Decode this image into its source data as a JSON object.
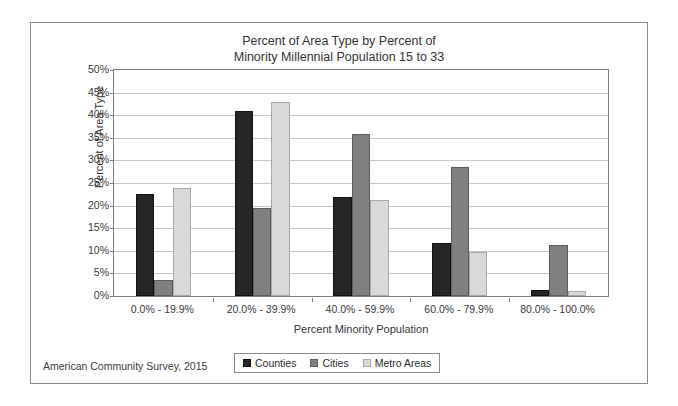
{
  "chart_data": {
    "type": "bar",
    "title": "Percent of Area Type by Percent of Minority Millennial Population 15 to 33",
    "title_lines": [
      "Percent of Area Type by Percent of",
      "Minority Millennial Population 15 to 33"
    ],
    "xlabel": "Percent Minority Population",
    "ylabel": "Percent of Area Type",
    "categories": [
      "0.0% - 19.9%",
      "20.0% - 39.9%",
      "40.0% - 59.9%",
      "60.0% - 79.9%",
      "80.0% - 100.0%"
    ],
    "series": [
      {
        "name": "Counties",
        "color": "#262626",
        "values": [
          22.5,
          41.0,
          22.0,
          11.7,
          1.3
        ]
      },
      {
        "name": "Cities",
        "color": "#808080",
        "values": [
          3.5,
          19.5,
          35.8,
          28.5,
          11.3
        ]
      },
      {
        "name": "Metro Areas",
        "color": "#d9d9d9",
        "values": [
          23.8,
          43.0,
          21.3,
          9.7,
          1.0
        ]
      }
    ],
    "ylim": [
      0,
      50
    ],
    "ytick_values": [
      0,
      5,
      10,
      15,
      20,
      25,
      30,
      35,
      40,
      45,
      50
    ],
    "ytick_labels": [
      "0%",
      "5%",
      "10%",
      "15%",
      "20%",
      "25%",
      "30%",
      "35%",
      "40%",
      "45%",
      "50%"
    ],
    "grid": true,
    "legend_position": "bottom-center",
    "value_suffix": "%"
  },
  "source_note": "American Community Survey, 2015",
  "legend": {
    "items": [
      {
        "label": "Counties"
      },
      {
        "label": "Cities"
      },
      {
        "label": "Metro Areas"
      }
    ]
  }
}
